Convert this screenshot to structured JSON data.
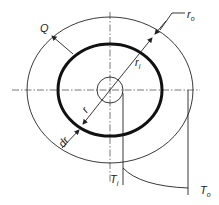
{
  "diagram": {
    "labels": {
      "heat_flow": "Q",
      "outer_radius": "r",
      "outer_radius_sub": "o",
      "inner_radius": "r",
      "inner_radius_sub": "i",
      "radius": "r",
      "thickness": "dr",
      "inner_temp": "T",
      "inner_temp_sub": "i",
      "outer_temp": "T",
      "outer_temp_sub": "o"
    },
    "colors": {
      "stroke": "#222222",
      "centerline": "#555555",
      "background": "#ffffff"
    }
  }
}
